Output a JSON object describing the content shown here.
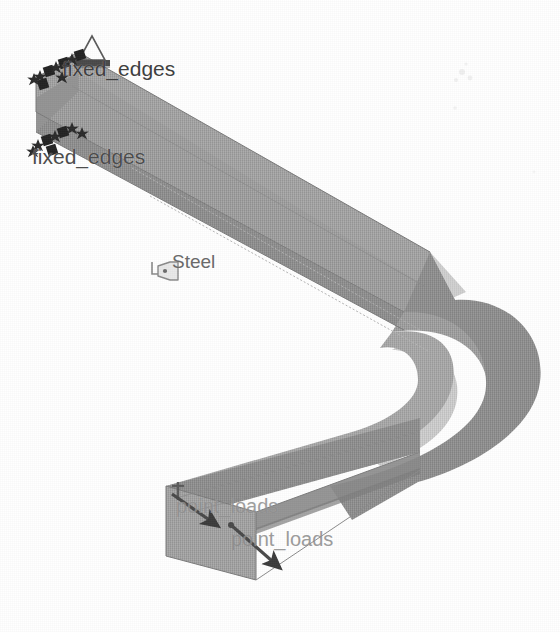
{
  "view": {
    "title": "FEA Beam Model",
    "background_color": "#ffffff",
    "projection": "isometric"
  },
  "model": {
    "name": "U-shaped channel beam",
    "material_label": "Steel",
    "colors": {
      "face_top": "#9c9c9c",
      "face_side": "#8f8f8f",
      "face_inner": "#a6a6a6",
      "face_highlight": "#c9c9c9",
      "face_end": "#a0a0a0",
      "edge_line": "#7a7a7a",
      "annotation_dark": "#454545",
      "annotation_ghost": "#8d8d8d"
    }
  },
  "annotations": {
    "fixed_edges_1": {
      "label": "fixed_edges",
      "icon": "fixed-constraint-icon",
      "type": "boundary-condition"
    },
    "fixed_edges_2": {
      "label": "fixed_edges",
      "icon": "fixed-constraint-icon",
      "type": "boundary-condition"
    },
    "material_tag": {
      "label": "Steel",
      "icon": "material-tag-icon",
      "type": "material"
    },
    "point_loads_1": {
      "label": "point_loads",
      "icon": "load-arrow-icon",
      "type": "load"
    },
    "point_loads_2": {
      "label": "point_loads",
      "icon": "load-arrow-icon",
      "type": "load"
    },
    "support_symbol": {
      "label": "",
      "icon": "pin-support-icon",
      "type": "support"
    }
  }
}
